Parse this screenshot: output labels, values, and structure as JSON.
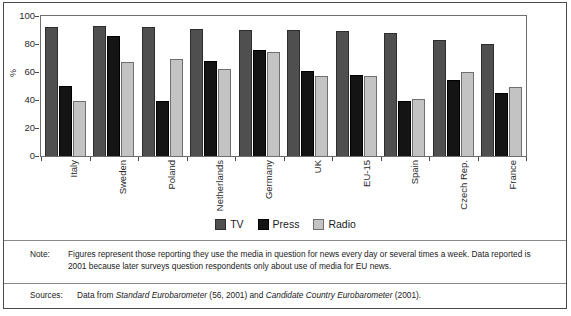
{
  "chart_data": {
    "type": "bar",
    "title": "",
    "xlabel": "",
    "ylabel": "%",
    "ylim": [
      0,
      100
    ],
    "yticks": [
      100,
      80,
      60,
      40,
      20,
      0
    ],
    "grid": false,
    "legend_position": "bottom-center",
    "categories": [
      "Italy",
      "Sweden",
      "Poland",
      "Netherlands",
      "Germany",
      "UK",
      "EU-15",
      "Spain",
      "Czech Rep.",
      "France"
    ],
    "series": [
      {
        "name": "TV",
        "color": "#4f4f4f",
        "values": [
          92,
          93,
          92,
          91,
          90,
          90,
          89,
          88,
          83,
          80
        ]
      },
      {
        "name": "Press",
        "color": "#141414",
        "values": [
          50,
          86,
          39,
          68,
          76,
          61,
          58,
          39,
          54,
          45
        ]
      },
      {
        "name": "Radio",
        "color": "#c3c3c3",
        "values": [
          39,
          67,
          69,
          62,
          74,
          57,
          57,
          41,
          60,
          49
        ]
      }
    ]
  },
  "footnotes": {
    "note_label": "Note:",
    "note_text": "Figures represent those reporting they use the media in question for news every day or several times a week. Data reported is 2001 because later surveys question respondents only about use of media for EU news.",
    "sources_label": "Sources:",
    "sources_prefix": "Data from ",
    "sources_italic_1": "Standard Eurobarometer",
    "sources_mid": " (56, 2001) and ",
    "sources_italic_2": "Candidate Country Eurobarometer",
    "sources_suffix": " (2001)."
  }
}
